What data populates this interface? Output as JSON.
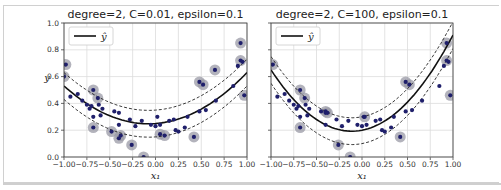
{
  "chart_data": [
    {
      "type": "scatter",
      "title": "degree=2, C=0.01, epsilon=0.1",
      "xlabel": "x₁",
      "ylabel": "y",
      "xlim": [
        -1.0,
        1.0
      ],
      "ylim": [
        0.0,
        1.0
      ],
      "xticks": [
        "−1.00",
        "−0.75",
        "−0.50",
        "−0.25",
        "0.00",
        "0.25",
        "0.50",
        "0.75",
        "1.00"
      ],
      "yticks": [
        "0.0",
        "0.2",
        "0.4",
        "0.6",
        "0.8",
        "1.0"
      ],
      "grid": true,
      "legend": {
        "position": "upper left",
        "entries": [
          "ŷ"
        ]
      },
      "model_curve": {
        "a": 0.33,
        "b": 0.05,
        "c": 0.25,
        "epsilon": 0.1
      },
      "support_vectors": [
        [
          -0.98,
          0.69
        ],
        [
          -1.0,
          0.6
        ],
        [
          -0.68,
          0.5
        ],
        [
          -0.63,
          0.44
        ],
        [
          -0.68,
          0.22
        ],
        [
          -0.48,
          0.19
        ],
        [
          -0.4,
          0.14
        ],
        [
          -0.38,
          0.16
        ],
        [
          -0.26,
          0.09
        ],
        [
          -0.13,
          0.0
        ],
        [
          0.05,
          0.17
        ],
        [
          0.1,
          0.16
        ],
        [
          0.42,
          0.15
        ],
        [
          0.48,
          0.56
        ],
        [
          0.52,
          0.54
        ],
        [
          0.65,
          0.65
        ],
        [
          0.93,
          0.85
        ],
        [
          0.93,
          0.72
        ],
        [
          0.97,
          0.46
        ]
      ]
    },
    {
      "type": "scatter",
      "title": "degree=2, C=100, epsilon=0.1",
      "xlabel": "x₁",
      "ylabel": "",
      "xlim": [
        -1.0,
        1.0
      ],
      "ylim": [
        0.0,
        1.0
      ],
      "xticks": [
        "−1.00",
        "−0.75",
        "−0.50",
        "−0.25",
        "0.00",
        "0.25",
        "0.50",
        "0.75",
        "1.00"
      ],
      "yticks": [
        "0.0",
        "0.2",
        "0.4",
        "0.6",
        "0.8",
        "1.0"
      ],
      "grid": true,
      "legend": {
        "position": "upper left",
        "entries": [
          "ŷ"
        ]
      },
      "model_curve": {
        "a": 0.58,
        "b": 0.13,
        "c": 0.2,
        "epsilon": 0.1
      },
      "support_vectors": [
        [
          -0.98,
          0.69
        ],
        [
          -0.68,
          0.5
        ],
        [
          -0.63,
          0.44
        ],
        [
          -0.68,
          0.22
        ],
        [
          -0.4,
          0.34
        ],
        [
          -0.38,
          0.33
        ],
        [
          -0.26,
          0.09
        ],
        [
          -0.13,
          0.0
        ],
        [
          0.03,
          0.3
        ],
        [
          0.42,
          0.15
        ],
        [
          0.48,
          0.56
        ],
        [
          0.52,
          0.54
        ],
        [
          0.93,
          0.85
        ],
        [
          0.93,
          0.72
        ],
        [
          0.97,
          0.46
        ]
      ]
    }
  ],
  "data_points": [
    [
      -0.93,
      0.45
    ],
    [
      -0.85,
      0.47
    ],
    [
      -0.8,
      0.42
    ],
    [
      -0.75,
      0.39
    ],
    [
      -0.72,
      0.36
    ],
    [
      -0.7,
      0.38
    ],
    [
      -0.68,
      0.3
    ],
    [
      -0.62,
      0.39
    ],
    [
      -0.58,
      0.36
    ],
    [
      -0.6,
      0.31
    ],
    [
      -0.45,
      0.34
    ],
    [
      -0.4,
      0.33
    ],
    [
      -0.4,
      0.24
    ],
    [
      -0.28,
      0.28
    ],
    [
      -0.22,
      0.23
    ],
    [
      -0.15,
      0.27
    ],
    [
      -0.05,
      0.24
    ],
    [
      0.0,
      0.23
    ],
    [
      0.02,
      0.3
    ],
    [
      0.05,
      0.24
    ],
    [
      0.15,
      0.27
    ],
    [
      0.2,
      0.28
    ],
    [
      0.22,
      0.2
    ],
    [
      0.25,
      0.19
    ],
    [
      0.32,
      0.22
    ],
    [
      0.35,
      0.3
    ],
    [
      0.48,
      0.34
    ],
    [
      0.55,
      0.35
    ],
    [
      0.66,
      0.42
    ],
    [
      0.85,
      0.53
    ],
    [
      0.9,
      0.68
    ],
    [
      0.95,
      0.71
    ]
  ]
}
